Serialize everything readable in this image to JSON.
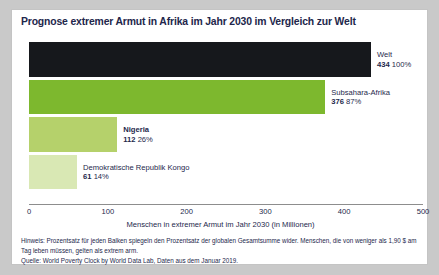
{
  "chart_data": {
    "type": "bar",
    "orientation": "horizontal",
    "title": "Prognose extremer Armut in Afrika im Jahr 2030 im Vergleich zur Welt",
    "xlabel": "Menschen in extremer Armut im Jahr 2030 (in Millionen)",
    "ylabel": "",
    "xlim": [
      0,
      500
    ],
    "xticks": [
      0,
      100,
      200,
      300,
      400,
      500
    ],
    "xtick_labels": [
      "0",
      "100",
      "200",
      "300",
      "400",
      "500"
    ],
    "grid": false,
    "legend": "none",
    "categories": [
      "Welt",
      "Subsahara-Afrika",
      "Nigeria",
      "Demokratische Republik Kongo"
    ],
    "values": [
      434,
      376,
      112,
      61
    ],
    "percent_labels": [
      "100%",
      "87%",
      "26%",
      "14%"
    ],
    "value_labels": [
      "434",
      "376",
      "112",
      "61"
    ],
    "colors": [
      "#16181c",
      "#7db82e",
      "#b5d16b",
      "#d9e8b4"
    ],
    "bars": [
      {
        "label": "Welt",
        "value": 434,
        "value_label": "434",
        "percent": "100%",
        "color": "#16181c",
        "label_bold": false
      },
      {
        "label": "Subsahara-Afrika",
        "value": 376,
        "value_label": "376",
        "percent": "87%",
        "color": "#7db82e",
        "label_bold": false
      },
      {
        "label": "Nigeria",
        "value": 112,
        "value_label": "112",
        "percent": "26%",
        "color": "#b5d16b",
        "label_bold": true
      },
      {
        "label": "Demokratische Republik Kongo",
        "value": 61,
        "value_label": "61",
        "percent": "14%",
        "color": "#d9e8b4",
        "label_bold": false
      }
    ]
  },
  "footnote": {
    "note": "Hinweis: Prozentsatz für jeden Balken spiegeln den Prozentsatz der globalen Gesamtsumme wider. Menschen, die von weniger als 1,90 $ am Tag leben müssen, gelten als extrem arm.",
    "source": "Quelle: World Poverty Clock by World Data Lab, Daten aus dem Januar 2019."
  },
  "colors": {
    "title": "#22264b",
    "text": "#24284c",
    "axis": "#8d8d8d",
    "card_bg": "#ffffff",
    "page_bg": "#c9c9c9"
  }
}
